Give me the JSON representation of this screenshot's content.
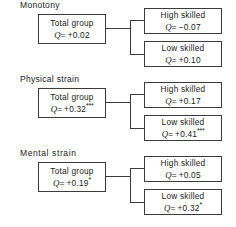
{
  "diagram": {
    "title": "",
    "sections": [
      {
        "id": "monotony",
        "label": "Monotony",
        "total": {
          "line1": "Total group",
          "q_prefix": "Q",
          "q_value": "= +0.02",
          "stars": ""
        },
        "high": {
          "line1": "High skilled",
          "q_prefix": "Q",
          "q_value": "= −0.07",
          "stars": ""
        },
        "low": {
          "line1": "Low skilled",
          "q_prefix": "Q",
          "q_value": "= +0.10",
          "stars": ""
        }
      },
      {
        "id": "physical-strain",
        "label": "Physical strain",
        "total": {
          "line1": "Total group",
          "q_prefix": "Q",
          "q_value": "= +0.32",
          "stars": "***"
        },
        "high": {
          "line1": "High skilled",
          "q_prefix": "Q",
          "q_value": "= +0.17",
          "stars": ""
        },
        "low": {
          "line1": "Low skilled",
          "q_prefix": "Q",
          "q_value": "= +0.41",
          "stars": "***"
        }
      },
      {
        "id": "mental-strain",
        "label": "Mental  strain",
        "total": {
          "line1": "Total group",
          "q_prefix": "Q",
          "q_value": "= +0.19",
          "stars": "*"
        },
        "high": {
          "line1": "High skilled",
          "q_prefix": "Q",
          "q_value": "= +0.05",
          "stars": ""
        },
        "low": {
          "line1": "Low skilled",
          "q_prefix": "Q",
          "q_value": "= +0.32",
          "stars": "*"
        }
      }
    ],
    "colors": {
      "line": "#3a3a3a",
      "text": "#1a1a1a",
      "background": "#ffffff"
    }
  }
}
